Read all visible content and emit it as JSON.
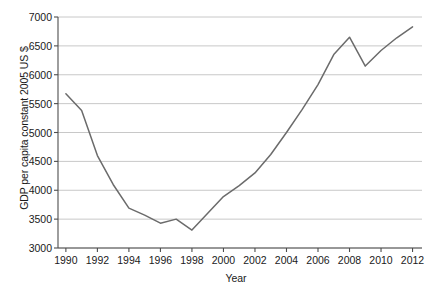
{
  "chart_data": {
    "type": "line",
    "title": "",
    "xlabel": "Year",
    "ylabel": "GDP per capita constant 2005 US $",
    "xlim": [
      1989.5,
      2012.6
    ],
    "ylim": [
      3000,
      7000
    ],
    "grid": true,
    "grid_axis": "y",
    "legend": false,
    "legend_position": "none",
    "line_color": "#6b6b6b",
    "axis_color": "#4d4d4d",
    "grid_color": "#c8c8c8",
    "background_color": "#ffffff",
    "yticks": [
      3000,
      3500,
      4000,
      4500,
      5000,
      5500,
      6000,
      6500,
      7000
    ],
    "ytick_labels": [
      "3000",
      "3500",
      "4000",
      "4500",
      "5000",
      "5500",
      "6000",
      "6500",
      "7000"
    ],
    "xticks": [
      1990,
      1992,
      1994,
      1996,
      1998,
      2000,
      2002,
      2004,
      2006,
      2008,
      2010,
      2012
    ],
    "xtick_labels": [
      "1990",
      "1992",
      "1994",
      "1996",
      "1998",
      "2000",
      "2002",
      "2004",
      "2006",
      "2008",
      "2010",
      "2012"
    ],
    "x": [
      1990,
      1991,
      1992,
      1993,
      1994,
      1995,
      1996,
      1997,
      1998,
      1999,
      2000,
      2001,
      2002,
      2003,
      2004,
      2005,
      2006,
      2007,
      2008,
      2009,
      2010,
      2011,
      2012
    ],
    "values": [
      5670,
      5380,
      4600,
      4100,
      3690,
      3570,
      3430,
      3500,
      3310,
      3600,
      3890,
      4080,
      4300,
      4620,
      5000,
      5400,
      5830,
      6350,
      6650,
      6150,
      6420,
      6640,
      6830
    ],
    "series": [
      {
        "name": "GDP per capita",
        "values": [
          5670,
          5380,
          4600,
          4100,
          3690,
          3570,
          3430,
          3500,
          3310,
          3600,
          3890,
          4080,
          4300,
          4620,
          5000,
          5400,
          5830,
          6350,
          6650,
          6150,
          6420,
          6640,
          6830
        ]
      }
    ],
    "annotations": []
  }
}
